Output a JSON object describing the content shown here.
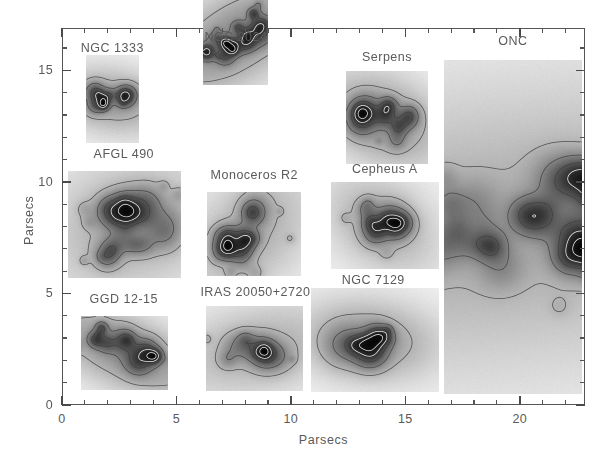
{
  "figure": {
    "background_color": "#ffffff",
    "axis_color": "#555555",
    "text_color": "#5a5a5a",
    "panel_background": "#f1f1f1"
  },
  "axes": {
    "xlabel": "Parsecs",
    "ylabel": "Parsecs",
    "x_ticklabels": [
      "0",
      "5",
      "10",
      "15",
      "20"
    ],
    "x_tickvalues": [
      0,
      5,
      10,
      15,
      20
    ],
    "y_ticklabels": [
      "0",
      "5",
      "10",
      "15"
    ],
    "y_tickvalues": [
      0,
      5,
      10,
      15
    ],
    "xlim": [
      0,
      22.85
    ],
    "ylim": [
      0,
      16.9
    ],
    "minor_tick_step": 1,
    "grid": "off"
  },
  "chart_data": {
    "type": "heatmap",
    "title": "",
    "xlabel": "Parsecs",
    "ylabel": "Parsecs",
    "xlim": [
      0,
      22.85
    ],
    "ylim": [
      0,
      16.9
    ],
    "panels": [
      {
        "label": "NGC 1333",
        "x": 1.05,
        "y": 11.75,
        "width": 2.3,
        "height": 3.95,
        "label_x": 2.2,
        "label_y": 16.0,
        "seed": 11,
        "blobs": 9,
        "core_x": 0.5,
        "core_y": 0.52,
        "core_radius": 0.3,
        "spread": 0.16,
        "intensity": 0.95,
        "elongation": 1.45,
        "angle": 10
      },
      {
        "label": "NGC 2024",
        "x": 6.15,
        "y": 14.35,
        "width": 2.85,
        "height": 4.25,
        "label_x": 7.6,
        "label_y": 16.5,
        "seed": 24,
        "blobs": 14,
        "core_x": 0.5,
        "core_y": 0.5,
        "core_radius": 0.34,
        "spread": 0.2,
        "intensity": 1.0,
        "elongation": 1.75,
        "angle": -32
      },
      {
        "label": "Serpens",
        "x": 12.4,
        "y": 10.8,
        "width": 3.6,
        "height": 4.15,
        "label_x": 14.2,
        "label_y": 15.6,
        "seed": 37,
        "blobs": 7,
        "core_x": 0.45,
        "core_y": 0.52,
        "core_radius": 0.26,
        "spread": 0.2,
        "intensity": 0.9,
        "elongation": 1.25,
        "angle": 25
      },
      {
        "label": "ONC",
        "x": 16.7,
        "y": 0.5,
        "width": 6.05,
        "height": 14.95,
        "label_x": 19.7,
        "label_y": 16.3,
        "seed": 51,
        "blobs": 58,
        "core_x": 0.45,
        "core_y": 0.5,
        "core_radius": 0.5,
        "spread": 0.42,
        "intensity": 1.0,
        "elongation": 2.8,
        "angle": -6
      },
      {
        "label": "AFGL 490",
        "x": 0.25,
        "y": 5.7,
        "width": 4.95,
        "height": 4.8,
        "label_x": 2.7,
        "label_y": 11.25,
        "seed": 63,
        "blobs": 17,
        "core_x": 0.55,
        "core_y": 0.5,
        "core_radius": 0.32,
        "spread": 0.23,
        "intensity": 0.92,
        "elongation": 1.15,
        "angle": -20
      },
      {
        "label": "Monoceros R2",
        "x": 6.35,
        "y": 5.8,
        "width": 4.1,
        "height": 3.75,
        "label_x": 8.4,
        "label_y": 10.3,
        "seed": 77,
        "blobs": 16,
        "core_x": 0.45,
        "core_y": 0.5,
        "core_radius": 0.3,
        "spread": 0.26,
        "intensity": 0.92,
        "elongation": 1.3,
        "angle": -45
      },
      {
        "label": "Cepheus A",
        "x": 11.75,
        "y": 6.1,
        "width": 4.7,
        "height": 3.9,
        "label_x": 14.1,
        "label_y": 10.6,
        "seed": 89,
        "blobs": 10,
        "core_x": 0.47,
        "core_y": 0.48,
        "core_radius": 0.25,
        "spread": 0.17,
        "intensity": 0.94,
        "elongation": 1.2,
        "angle": 35
      },
      {
        "label": "GGD 12-15",
        "x": 0.85,
        "y": 0.7,
        "width": 3.8,
        "height": 3.3,
        "label_x": 2.7,
        "label_y": 4.75,
        "seed": 97,
        "blobs": 8,
        "core_x": 0.5,
        "core_y": 0.48,
        "core_radius": 0.24,
        "spread": 0.16,
        "intensity": 0.95,
        "elongation": 2.1,
        "angle": 24
      },
      {
        "label": "IRAS 20050+2720",
        "x": 6.3,
        "y": 0.65,
        "width": 4.25,
        "height": 3.8,
        "label_x": 8.45,
        "label_y": 5.05,
        "seed": 103,
        "blobs": 9,
        "core_x": 0.55,
        "core_y": 0.5,
        "core_radius": 0.26,
        "spread": 0.17,
        "intensity": 0.95,
        "elongation": 1.8,
        "angle": -12
      },
      {
        "label": "NGC 7129",
        "x": 10.9,
        "y": 0.6,
        "width": 5.6,
        "height": 4.65,
        "label_x": 13.6,
        "label_y": 5.6,
        "seed": 113,
        "blobs": 6,
        "core_x": 0.45,
        "core_y": 0.5,
        "core_radius": 0.19,
        "spread": 0.1,
        "intensity": 0.92,
        "elongation": 1.5,
        "angle": 5
      }
    ]
  }
}
